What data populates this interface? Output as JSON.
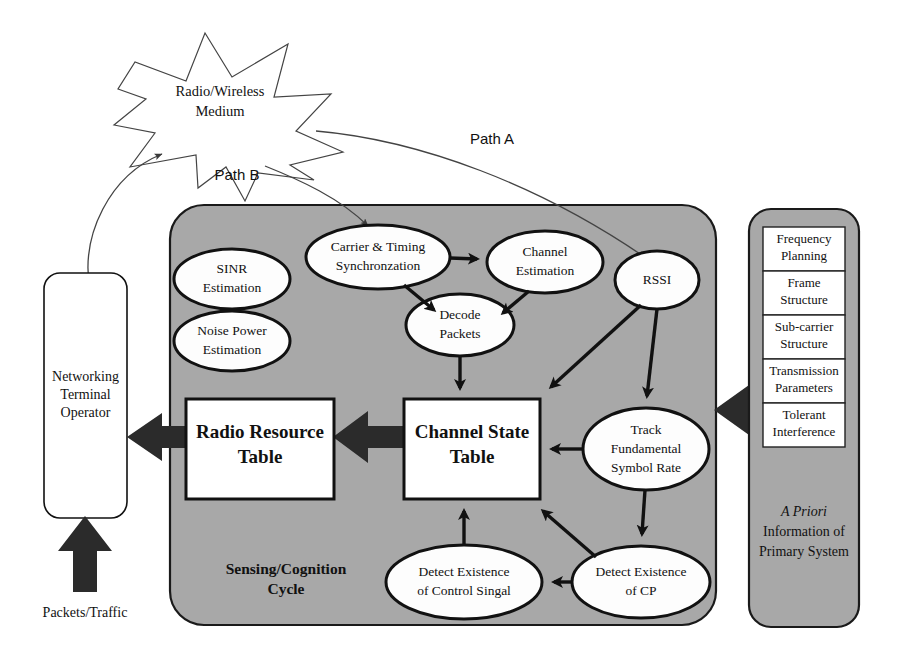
{
  "figure": {
    "type": "block-diagram"
  },
  "medium": {
    "name": "radio-wireless-medium",
    "line1": "Radio/Wireless",
    "line2": "Medium"
  },
  "paths": {
    "path_a": "Path A",
    "path_b": "Path B"
  },
  "left": {
    "operator": {
      "line1": "Networking",
      "line2": "Terminal",
      "line3": "Operator"
    },
    "traffic_label": "Packets/Traffic"
  },
  "cycle": {
    "label_line1": "Sensing/Cognition",
    "label_line2": "Cycle",
    "nodes": [
      {
        "id": "sinr",
        "line1": "SINR",
        "line2": "Estimation",
        "line3": ""
      },
      {
        "id": "noise",
        "line1": "Noise Power",
        "line2": "Estimation",
        "line3": ""
      },
      {
        "id": "carrier",
        "line1": "Carrier & Timing",
        "line2": "Synchronzation",
        "line3": ""
      },
      {
        "id": "chest",
        "line1": "Channel",
        "line2": "Estimation",
        "line3": ""
      },
      {
        "id": "rssi",
        "line1": "RSSI",
        "line2": "",
        "line3": ""
      },
      {
        "id": "decode",
        "line1": "Decode",
        "line2": "Packets",
        "line3": ""
      },
      {
        "id": "track",
        "line1": "Track",
        "line2": "Fundamental",
        "line3": "Symbol Rate"
      },
      {
        "id": "cp",
        "line1": "Detect Existence",
        "line2": "of CP",
        "line3": ""
      },
      {
        "id": "ctrl",
        "line1": "Detect Existence",
        "line2": "of Control Singal",
        "line3": ""
      }
    ],
    "tables": [
      {
        "id": "rrt",
        "line1": "Radio Resource",
        "line2": "Table"
      },
      {
        "id": "cst",
        "line1": "Channel State",
        "line2": "Table"
      }
    ]
  },
  "right": {
    "cells": [
      {
        "line1": "Frequency",
        "line2": "Planning"
      },
      {
        "line1": "Frame",
        "line2": "Structure"
      },
      {
        "line1": "Sub-carrier",
        "line2": "Structure"
      },
      {
        "line1": "Transmission",
        "line2": "Parameters"
      },
      {
        "line1": "Tolerant",
        "line2": "Interference"
      }
    ],
    "caption": {
      "line1": "A Priori",
      "line2": "Information of",
      "line3": "Primary System"
    }
  },
  "colors": {
    "panel_gray": "#a8a8a8",
    "node_white": "#fdfdfd",
    "stroke_dark": "#111111",
    "arrow_fill": "#2b2b2b",
    "page_bg": "#ffffff"
  }
}
